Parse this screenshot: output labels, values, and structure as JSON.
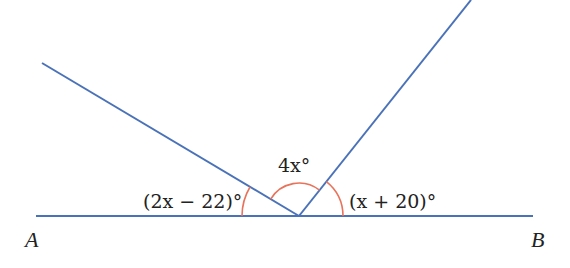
{
  "diagram": {
    "type": "angles-on-a-straight-line",
    "colors": {
      "line": "#4a72b8",
      "arc": "#e8735a",
      "text": "#222222"
    },
    "points": {
      "A": {
        "label": "A"
      },
      "B": {
        "label": "B"
      }
    },
    "angles": [
      {
        "id": "left",
        "label": "(2x − 22)°"
      },
      {
        "id": "middle",
        "label": "4x°"
      },
      {
        "id": "right",
        "label": "(x + 20)°"
      }
    ]
  }
}
